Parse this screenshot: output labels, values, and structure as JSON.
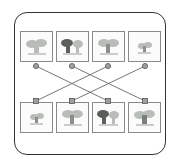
{
  "diagram": {
    "type": "bipartite-matching",
    "top_row": [
      {
        "id": "t1",
        "variant": "light",
        "connects_to": "b3"
      },
      {
        "id": "t2",
        "variant": "dark",
        "connects_to": "b4"
      },
      {
        "id": "t3",
        "variant": "light",
        "connects_to": "b1"
      },
      {
        "id": "t4",
        "variant": "small",
        "connects_to": "b2"
      }
    ],
    "bottom_row": [
      {
        "id": "b1",
        "variant": "small"
      },
      {
        "id": "b2",
        "variant": "light"
      },
      {
        "id": "b3",
        "variant": "dark"
      },
      {
        "id": "b4",
        "variant": "light"
      }
    ],
    "colors": {
      "frame": "#333333",
      "tile_border": "#8a8a8a",
      "connector": "#666666",
      "node_fill": "#9aa39a",
      "tree_light": "#b8bdb8",
      "tree_dark": "#5a5f5a"
    }
  }
}
